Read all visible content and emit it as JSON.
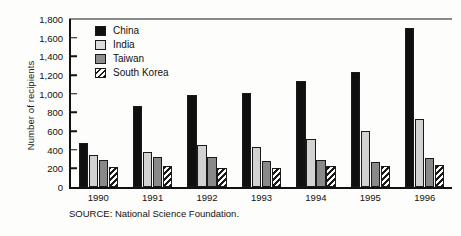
{
  "chart_data": {
    "type": "bar",
    "title": "",
    "xlabel": "",
    "ylabel": "Number of recipients",
    "categories": [
      "1990",
      "1991",
      "1992",
      "1993",
      "1994",
      "1995",
      "1996"
    ],
    "series": [
      {
        "name": "China",
        "values": [
          470,
          865,
          985,
          1005,
          1140,
          1230,
          1700
        ]
      },
      {
        "name": "India",
        "values": [
          345,
          375,
          450,
          425,
          510,
          600,
          730
        ]
      },
      {
        "name": "Taiwan",
        "values": [
          290,
          325,
          325,
          275,
          290,
          265,
          310
        ]
      },
      {
        "name": "South Korea",
        "values": [
          210,
          230,
          205,
          200,
          230,
          225,
          240
        ]
      }
    ],
    "ylim": [
      0,
      1800
    ],
    "yticks": [
      "0",
      "200",
      "400",
      "600",
      "800",
      "1,000",
      "1,200",
      "1,400",
      "1,600",
      "1,800"
    ],
    "ytick_values": [
      0,
      200,
      400,
      600,
      800,
      1000,
      1200,
      1400,
      1600,
      1800
    ],
    "grid": false,
    "legend_position": "upper-left-inside",
    "colors": {
      "China": "#101010",
      "India": "#d2d2d2",
      "Taiwan": "#898989",
      "South Korea": "#ffffff"
    }
  },
  "legend": {
    "items": [
      {
        "label": "China",
        "key": "china"
      },
      {
        "label": "India",
        "key": "india"
      },
      {
        "label": "Taiwan",
        "key": "taiwan"
      },
      {
        "label": "South Korea",
        "key": "korea"
      }
    ]
  },
  "source": {
    "text": "SOURCE: National Science Foundation."
  }
}
